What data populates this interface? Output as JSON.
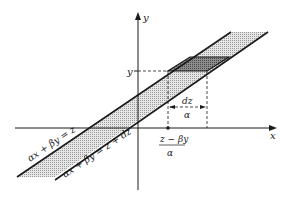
{
  "diagram": {
    "axes": {
      "x_label": "x",
      "y_label": "y"
    },
    "lines": {
      "upper_label": "αx + βy = z",
      "lower_label": "αx + βy = z + dz"
    },
    "annotations": {
      "y_level_label": "y",
      "width_numerator": "dz",
      "width_denominator": "α",
      "x_point_numerator": "z − βy",
      "x_point_denominator": "α"
    },
    "colors": {
      "ink": "#1a1a1a",
      "band_fill": "#cfcfcf",
      "strip_fill": "#8a8a8a",
      "background": "#ffffff"
    }
  }
}
